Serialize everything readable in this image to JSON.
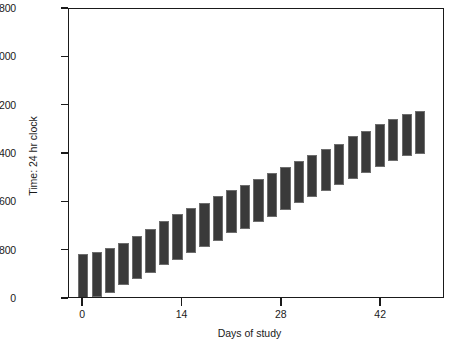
{
  "chart_data": {
    "type": "bar",
    "bar_style": "floating-range",
    "title": "",
    "subtitle": "",
    "xlabel": "Days of study",
    "ylabel": "Time: 24 hr clock",
    "xlim": [
      -2,
      51
    ],
    "ylim": [
      0,
      4800
    ],
    "xticks": [
      0,
      14,
      28,
      42
    ],
    "xtick_labels": [
      "0",
      "14",
      "28",
      "42"
    ],
    "yticks": [
      0,
      800,
      1600,
      2400,
      3200,
      4000,
      4800
    ],
    "ytick_labels": [
      "0",
      "800",
      "1600",
      "2400",
      "3200",
      "4000",
      "4800"
    ],
    "grid": false,
    "legend": null,
    "legend_position": "none",
    "bar_color": "#3a3a3a",
    "bar_edge_color": "#6d6d6d",
    "axis_color": "#1a1a1a",
    "background_color": "#ffffff",
    "series_name": "Sleep episode interval",
    "x": [
      0,
      1.9,
      3.8,
      5.7,
      7.6,
      9.5,
      11.4,
      13.3,
      15.2,
      17.1,
      19.0,
      20.9,
      22.8,
      24.7,
      26.6,
      28.5,
      30.4,
      32.3,
      34.2,
      36.1,
      38.0,
      39.9,
      41.8,
      43.7,
      45.6,
      47.5
    ],
    "bottom_values": [
      0,
      30,
      100,
      230,
      330,
      430,
      560,
      640,
      760,
      860,
      960,
      1090,
      1160,
      1280,
      1360,
      1480,
      1590,
      1690,
      1790,
      1890,
      1990,
      2090,
      2190,
      2280,
      2360,
      2400
    ],
    "top_values": [
      745,
      780,
      840,
      930,
      1050,
      1160,
      1290,
      1400,
      1500,
      1590,
      1700,
      1800,
      1890,
      1980,
      2080,
      2180,
      2290,
      2380,
      2480,
      2570,
      2690,
      2780,
      2890,
      2980,
      3060,
      3120
    ],
    "n_bars": 26,
    "bar_width_days": 1.45
  },
  "axes": {
    "y_title": "Time: 24 hr clock",
    "x_title": "Days of study"
  }
}
